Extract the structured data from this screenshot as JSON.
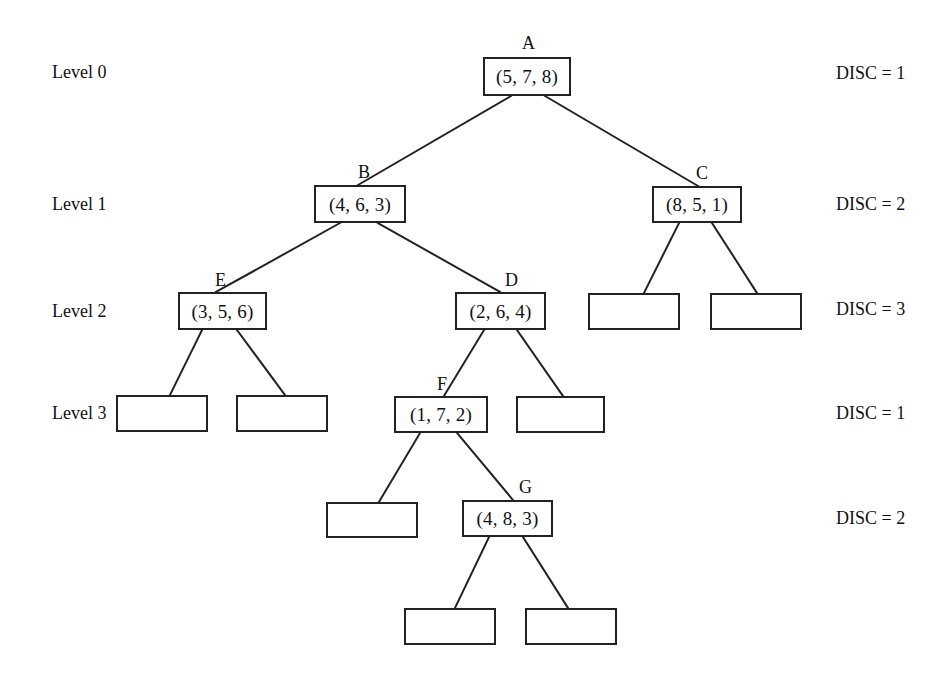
{
  "diagram": {
    "canvas": {
      "width": 942,
      "height": 676
    },
    "stroke_color": "#222222",
    "background_color": "#ffffff"
  },
  "level_labels": [
    {
      "text": "Level 0",
      "x": 52,
      "y": 63
    },
    {
      "text": "Level 1",
      "x": 52,
      "y": 195
    },
    {
      "text": "Level 2",
      "x": 52,
      "y": 302
    },
    {
      "text": "Level 3",
      "x": 52,
      "y": 404
    }
  ],
  "disc_labels": [
    {
      "text": "DISC = 1",
      "x": 836,
      "y": 64
    },
    {
      "text": "DISC = 2",
      "x": 836,
      "y": 195
    },
    {
      "text": "DISC = 3",
      "x": 836,
      "y": 300
    },
    {
      "text": "DISC = 1",
      "x": 836,
      "y": 404
    },
    {
      "text": "DISC = 2",
      "x": 836,
      "y": 509
    }
  ],
  "nodes": [
    {
      "id": "A",
      "name": "A",
      "value": "(5, 7, 8)",
      "x": 483,
      "y": 57,
      "w": 88,
      "h": 39,
      "label_x": 522,
      "label_y": 34,
      "empty": false
    },
    {
      "id": "B",
      "name": "B",
      "value": "(4, 6, 3)",
      "x": 314,
      "y": 185,
      "w": 92,
      "h": 38,
      "label_x": 358,
      "label_y": 163,
      "empty": false
    },
    {
      "id": "C",
      "name": "C",
      "value": "(8, 5, 1)",
      "x": 652,
      "y": 186,
      "w": 90,
      "h": 37,
      "label_x": 696,
      "label_y": 164,
      "empty": false
    },
    {
      "id": "E",
      "name": "E",
      "value": "(3, 5, 6)",
      "x": 178,
      "y": 292,
      "w": 89,
      "h": 38,
      "label_x": 215,
      "label_y": 271,
      "empty": false
    },
    {
      "id": "D",
      "name": "D",
      "value": "(2, 6, 4)",
      "x": 455,
      "y": 292,
      "w": 91,
      "h": 38,
      "label_x": 505,
      "label_y": 271,
      "empty": false
    },
    {
      "id": "C1",
      "name": "",
      "value": "",
      "x": 588,
      "y": 293,
      "w": 92,
      "h": 37,
      "empty": true
    },
    {
      "id": "C2",
      "name": "",
      "value": "",
      "x": 710,
      "y": 293,
      "w": 92,
      "h": 37,
      "empty": true
    },
    {
      "id": "E1",
      "name": "",
      "value": "",
      "x": 116,
      "y": 395,
      "w": 92,
      "h": 37,
      "empty": true
    },
    {
      "id": "E2",
      "name": "",
      "value": "",
      "x": 236,
      "y": 395,
      "w": 92,
      "h": 37,
      "empty": true
    },
    {
      "id": "F",
      "name": "F",
      "value": "(1, 7, 2)",
      "x": 394,
      "y": 396,
      "w": 94,
      "h": 37,
      "label_x": 437,
      "label_y": 375,
      "empty": false
    },
    {
      "id": "D2",
      "name": "",
      "value": "",
      "x": 516,
      "y": 396,
      "w": 89,
      "h": 37,
      "empty": true
    },
    {
      "id": "F1",
      "name": "",
      "value": "",
      "x": 326,
      "y": 502,
      "w": 92,
      "h": 36,
      "empty": true
    },
    {
      "id": "G",
      "name": "G",
      "value": "(4, 8, 3)",
      "x": 462,
      "y": 500,
      "w": 91,
      "h": 37,
      "label_x": 519,
      "label_y": 478,
      "empty": false
    },
    {
      "id": "G1",
      "name": "",
      "value": "",
      "x": 404,
      "y": 608,
      "w": 92,
      "h": 37,
      "empty": true
    },
    {
      "id": "G2",
      "name": "",
      "value": "",
      "x": 525,
      "y": 608,
      "w": 92,
      "h": 37,
      "empty": true
    }
  ],
  "edges": [
    {
      "from": "A",
      "to": "B",
      "x1": 511,
      "y1": 96,
      "x2": 358,
      "y2": 185
    },
    {
      "from": "A",
      "to": "C",
      "x1": 545,
      "y1": 96,
      "x2": 698,
      "y2": 186
    },
    {
      "from": "B",
      "to": "E",
      "x1": 340,
      "y1": 223,
      "x2": 216,
      "y2": 292
    },
    {
      "from": "B",
      "to": "D",
      "x1": 378,
      "y1": 223,
      "x2": 500,
      "y2": 292
    },
    {
      "from": "C",
      "to": "C1",
      "x1": 679,
      "y1": 223,
      "x2": 644,
      "y2": 293
    },
    {
      "from": "C",
      "to": "C2",
      "x1": 712,
      "y1": 223,
      "x2": 757,
      "y2": 293
    },
    {
      "from": "E",
      "to": "E1",
      "x1": 202,
      "y1": 330,
      "x2": 170,
      "y2": 395
    },
    {
      "from": "E",
      "to": "E2",
      "x1": 237,
      "y1": 330,
      "x2": 285,
      "y2": 395
    },
    {
      "from": "D",
      "to": "F",
      "x1": 484,
      "y1": 330,
      "x2": 444,
      "y2": 396
    },
    {
      "from": "D",
      "to": "D2",
      "x1": 517,
      "y1": 330,
      "x2": 563,
      "y2": 396
    },
    {
      "from": "F",
      "to": "F1",
      "x1": 420,
      "y1": 433,
      "x2": 379,
      "y2": 502
    },
    {
      "from": "F",
      "to": "G",
      "x1": 457,
      "y1": 433,
      "x2": 513,
      "y2": 500
    },
    {
      "from": "G",
      "to": "G1",
      "x1": 489,
      "y1": 537,
      "x2": 455,
      "y2": 608
    },
    {
      "from": "G",
      "to": "G2",
      "x1": 523,
      "y1": 537,
      "x2": 568,
      "y2": 608
    }
  ],
  "chart_data": {
    "type": "diagram",
    "tree": {
      "root": "A",
      "node_values": {
        "A": [
          5,
          7,
          8
        ],
        "B": [
          4,
          6,
          3
        ],
        "C": [
          8,
          5,
          1
        ],
        "E": [
          3,
          5,
          6
        ],
        "D": [
          2,
          6,
          4
        ],
        "F": [
          1,
          7,
          2
        ],
        "G": [
          4,
          8,
          3
        ]
      },
      "children": {
        "A": [
          "B",
          "C"
        ],
        "B": [
          "E",
          "D"
        ],
        "C": [
          "C1",
          "C2"
        ],
        "E": [
          "E1",
          "E2"
        ],
        "D": [
          "F",
          "D2"
        ],
        "F": [
          "F1",
          "G"
        ],
        "G": [
          "G1",
          "G2"
        ]
      },
      "empty_nodes": [
        "C1",
        "C2",
        "E1",
        "E2",
        "D2",
        "F1",
        "G1",
        "G2"
      ]
    },
    "rows": [
      {
        "level": "Level 0",
        "disc": 1,
        "nodes": [
          "A"
        ]
      },
      {
        "level": "Level 1",
        "disc": 2,
        "nodes": [
          "B",
          "C"
        ]
      },
      {
        "level": "Level 2",
        "disc": 3,
        "nodes": [
          "E",
          "D",
          "C1",
          "C2"
        ]
      },
      {
        "level": "Level 3",
        "disc": 1,
        "nodes": [
          "E1",
          "E2",
          "F",
          "D2"
        ]
      },
      {
        "level": "",
        "disc": 2,
        "nodes": [
          "F1",
          "G"
        ]
      },
      {
        "level": "",
        "disc": null,
        "nodes": [
          "G1",
          "G2"
        ]
      }
    ]
  }
}
